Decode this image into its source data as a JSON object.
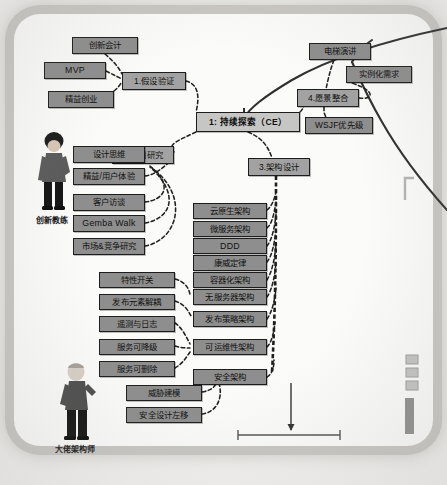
{
  "diagram": {
    "type": "mindmap",
    "frame": {
      "style": "rounded-photo-border",
      "color": "#c9c7c4"
    },
    "center_node": {
      "label": "1: 持续探索（CE）",
      "x": 196,
      "y": 112,
      "w": 104,
      "h": 20
    },
    "branch_nodes": [
      {
        "id": "b1",
        "label": "1.假设验证",
        "x": 122,
        "y": 72,
        "w": 64,
        "h": 18
      },
      {
        "id": "b2",
        "label": "2.协同研究",
        "x": 112,
        "y": 146,
        "w": 62,
        "h": 18
      },
      {
        "id": "b3",
        "label": "3.架构设计",
        "x": 248,
        "y": 158,
        "w": 62,
        "h": 18
      },
      {
        "id": "b4",
        "label": "4.愿景整合",
        "x": 297,
        "y": 89,
        "w": 62,
        "h": 18
      }
    ],
    "leaf_nodes": [
      {
        "id": "n01",
        "label": "创新会计",
        "x": 72,
        "y": 37,
        "w": 66,
        "h": 17
      },
      {
        "id": "n02",
        "label": "MVP",
        "x": 44,
        "y": 62,
        "w": 62,
        "h": 17,
        "latin": true
      },
      {
        "id": "n03",
        "label": "精益创业",
        "x": 48,
        "y": 91,
        "w": 66,
        "h": 17
      },
      {
        "id": "n04",
        "label": "电梯演讲",
        "x": 309,
        "y": 43,
        "w": 62,
        "h": 17
      },
      {
        "id": "n05",
        "label": "实例化需求",
        "x": 346,
        "y": 66,
        "w": 66,
        "h": 17
      },
      {
        "id": "n06",
        "label": "WSJF优先级",
        "x": 305,
        "y": 117,
        "w": 68,
        "h": 17
      },
      {
        "id": "n07",
        "label": "设计思维",
        "x": 73,
        "y": 146,
        "w": 72,
        "h": 17
      },
      {
        "id": "n08",
        "label": "精益/用户体验",
        "x": 73,
        "y": 168,
        "w": 72,
        "h": 17
      },
      {
        "id": "n09",
        "label": "客户访谈",
        "x": 73,
        "y": 194,
        "w": 72,
        "h": 17
      },
      {
        "id": "n10",
        "label": "Gemba Walk",
        "x": 73,
        "y": 215,
        "w": 72,
        "h": 17,
        "latin": true
      },
      {
        "id": "n11",
        "label": "市场&竞争研究",
        "x": 73,
        "y": 238,
        "w": 72,
        "h": 17
      },
      {
        "id": "n12",
        "label": "云原生架构",
        "x": 193,
        "y": 203,
        "w": 74,
        "h": 16
      },
      {
        "id": "n13",
        "label": "微服务架构",
        "x": 193,
        "y": 221,
        "w": 74,
        "h": 16
      },
      {
        "id": "n14",
        "label": "DDD",
        "x": 193,
        "y": 238,
        "w": 74,
        "h": 16,
        "latin": true
      },
      {
        "id": "n15",
        "label": "康威定律",
        "x": 193,
        "y": 255,
        "w": 74,
        "h": 16
      },
      {
        "id": "n16",
        "label": "容器化架构",
        "x": 193,
        "y": 272,
        "w": 74,
        "h": 16
      },
      {
        "id": "n17",
        "label": "无服务器架构",
        "x": 193,
        "y": 289,
        "w": 74,
        "h": 16
      },
      {
        "id": "n18",
        "label": "发布策略架构",
        "x": 193,
        "y": 311,
        "w": 74,
        "h": 16
      },
      {
        "id": "n19",
        "label": "可运维性架构",
        "x": 193,
        "y": 339,
        "w": 74,
        "h": 16
      },
      {
        "id": "n20",
        "label": "安全架构",
        "x": 193,
        "y": 369,
        "w": 74,
        "h": 16
      },
      {
        "id": "n21",
        "label": "特性开关",
        "x": 99,
        "y": 272,
        "w": 76,
        "h": 16
      },
      {
        "id": "n22",
        "label": "发布元素解耦",
        "x": 99,
        "y": 294,
        "w": 76,
        "h": 16
      },
      {
        "id": "n23",
        "label": "遥测与日志",
        "x": 99,
        "y": 316,
        "w": 76,
        "h": 16
      },
      {
        "id": "n24",
        "label": "服务可降级",
        "x": 99,
        "y": 339,
        "w": 76,
        "h": 16
      },
      {
        "id": "n25",
        "label": "服务可删除",
        "x": 99,
        "y": 361,
        "w": 76,
        "h": 16
      },
      {
        "id": "n26",
        "label": "威胁建模",
        "x": 126,
        "y": 385,
        "w": 76,
        "h": 16
      },
      {
        "id": "n27",
        "label": "安全设计左移",
        "x": 126,
        "y": 407,
        "w": 76,
        "h": 16
      }
    ],
    "personas": [
      {
        "id": "p1",
        "label": "创新教练",
        "x": 36,
        "y": 133,
        "figure": "person-standing-dark-hair"
      },
      {
        "id": "p2",
        "label": "大佬架构师",
        "x": 55,
        "y": 360,
        "figure": "person-standing-bald"
      }
    ],
    "colors": {
      "node_fill": "#8e8e8e",
      "node_fill_light": "#adadad",
      "center_fill": "#c6c6c4",
      "node_stroke": "#1d1d1d",
      "paper": "#fbfbfa",
      "frame": "#c9c7c4",
      "connector": "#222222"
    }
  }
}
